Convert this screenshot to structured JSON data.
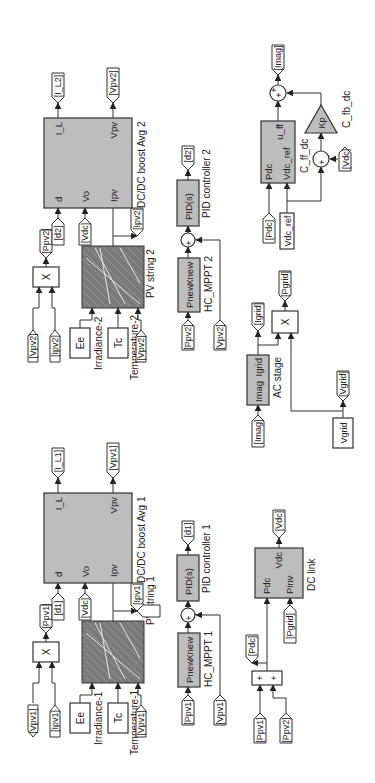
{
  "diagram": {
    "type": "Simulink block diagram",
    "orientation": "rotated 90 degrees counter-clockwise",
    "colors": {
      "block_fill": "#bdbdbd",
      "line": "#333333",
      "background": "#ffffff"
    },
    "pv_chain_1": {
      "product": {
        "label": "X",
        "inputs": [
          "[Vpv1]",
          "[Ipv1]"
        ],
        "output": "[Ppv1]"
      },
      "pv_string": {
        "name": "PV string 1",
        "inputs": [
          "Ee",
          "Tc",
          "[Vpv1]"
        ],
        "input_labels": [
          "Irradiance-1",
          "Temperature-1"
        ],
        "output_tag": "[Ipv1]"
      },
      "boost": {
        "name": "DC/DC boost Avg 1",
        "in_ports": [
          "d",
          "Vo",
          "Ipv"
        ],
        "out_ports": [
          "I_L",
          "Vpv"
        ],
        "in_tags": [
          "[d1]",
          "[Vdc]"
        ],
        "out_tags": [
          "[I_L1]",
          "[Vpv1]"
        ]
      },
      "mppt": {
        "name": "HC_MPPT 1",
        "ports": [
          "Pnew",
          "Xnew"
        ],
        "input": "[Ppv1]"
      },
      "sum_signs": [
        "+",
        "-"
      ],
      "sum_input": "[Vpv1]",
      "pid": {
        "name": "PID controller 1",
        "label": "PID(s)",
        "output": "[d1]"
      }
    },
    "pv_chain_2": {
      "product": {
        "label": "X",
        "inputs": [
          "[Vpv2]",
          "[Ipv2]"
        ],
        "output": "[Ppv2]"
      },
      "pv_string": {
        "name": "PV string 2",
        "inputs": [
          "Ee",
          "Tc",
          "[Vpv2]"
        ],
        "input_labels": [
          "Irradiance-2",
          "Temperature-2"
        ],
        "output_tag": "[Ipv2]"
      },
      "boost": {
        "name": "DC/DC boost Avg 2",
        "in_ports": [
          "d",
          "Vo",
          "Ipv"
        ],
        "out_ports": [
          "I_L",
          "Vpv"
        ],
        "in_tags": [
          "[d2]",
          "[Vdc]"
        ],
        "out_tags": [
          "[I_L2]",
          "[Vpv2]"
        ]
      },
      "mppt": {
        "name": "HC_MPPT 2",
        "ports": [
          "Pnew",
          "Xnew"
        ],
        "input": "[Ppv2]"
      },
      "sum_signs": [
        "+",
        "-"
      ],
      "sum_input": "[Vpv2]",
      "pid": {
        "name": "PID controller 2",
        "label": "PID(s)",
        "output": "[d2]"
      }
    },
    "dc_link": {
      "sum_inputs": [
        "[Ppv1]",
        "[Ppv2]"
      ],
      "sum_signs": [
        "+",
        "+"
      ],
      "pdc_tag": "[Pdc]",
      "block": {
        "name": "DC link",
        "in_ports": [
          "Pdc",
          "Pinv"
        ],
        "out_port": "Vdc",
        "pinv_input": "[Pgrid]",
        "output": "[Vdc]"
      }
    },
    "ac_stage": {
      "input": "[Imag]",
      "block": {
        "name": "AC stage",
        "ports": [
          "Imag",
          "Igrid"
        ]
      },
      "igrid_tag": "[Igrid]",
      "product": {
        "label": "X",
        "output": "[Pgrid]"
      },
      "vgrid_source": "Vgrid",
      "vgrid_tag": "[Vgrid]"
    },
    "controller": {
      "inputs": [
        "[Pdc]",
        "Vdc_ref"
      ],
      "ff_block": {
        "name": "C_ff_dc",
        "in_ports": [
          "Pdc",
          "Vdc_ref"
        ],
        "out_port": "u_ff"
      },
      "fb_sum_signs": [
        "+",
        "-"
      ],
      "fb_input": "[Vdc]",
      "gain": {
        "name": "C_fb_dc",
        "label": "Kp"
      },
      "out_sum_signs": [
        "+",
        "+"
      ],
      "output": "[Imag]"
    }
  }
}
